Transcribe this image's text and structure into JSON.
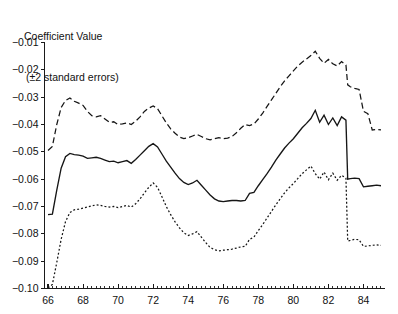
{
  "title": {
    "line1": "Coefficient Value",
    "line2": "(±2 standard errors)"
  },
  "chart_data": {
    "type": "line",
    "title": "Coefficient Value (±2 standard errors)",
    "xlabel": "",
    "ylabel": "Coefficient Value (±2 standard errors)",
    "xlim": [
      65.8,
      85.2
    ],
    "ylim": [
      -0.1,
      -0.01
    ],
    "grid": false,
    "legend": "none",
    "x_tick_labels": [
      "66",
      "68",
      "70",
      "72",
      "74",
      "76",
      "78",
      "80",
      "82",
      "84"
    ],
    "x_tick_values": [
      66,
      68,
      70,
      72,
      74,
      76,
      78,
      80,
      82,
      84
    ],
    "x_minor_tick_interval": 0.25,
    "y_tick_labels": [
      "-0.01",
      "-0.02",
      "-0.03",
      "-0.04",
      "-0.05",
      "-0.06",
      "-0.07",
      "-0.08",
      "-0.09",
      "-0.10"
    ],
    "y_tick_values": [
      -0.01,
      -0.02,
      -0.03,
      -0.04,
      -0.05,
      -0.06,
      -0.07,
      -0.08,
      -0.09,
      -0.1
    ],
    "x": [
      66.0,
      66.25,
      66.5,
      66.75,
      67.0,
      67.25,
      67.5,
      67.75,
      68.0,
      68.25,
      68.5,
      68.75,
      69.0,
      69.25,
      69.5,
      69.75,
      70.0,
      70.25,
      70.5,
      70.75,
      71.0,
      71.25,
      71.5,
      71.75,
      72.0,
      72.25,
      72.5,
      72.75,
      73.0,
      73.25,
      73.5,
      73.75,
      74.0,
      74.25,
      74.5,
      74.75,
      75.0,
      75.25,
      75.5,
      75.75,
      76.0,
      76.25,
      76.5,
      76.75,
      77.0,
      77.25,
      77.5,
      77.75,
      78.0,
      78.25,
      78.5,
      78.75,
      79.0,
      79.25,
      79.5,
      79.75,
      80.0,
      80.25,
      80.5,
      80.75,
      81.0,
      81.25,
      81.5,
      81.75,
      82.0,
      82.25,
      82.5,
      82.75,
      83.0,
      83.1,
      83.25,
      83.5,
      83.75,
      84.0,
      84.25,
      84.5,
      84.75,
      85.0
    ],
    "series": [
      {
        "name": "upper (+2 standard errors)",
        "style": "dashed",
        "values": [
          -0.0495,
          -0.048,
          -0.04,
          -0.0338,
          -0.0312,
          -0.0303,
          -0.0315,
          -0.0322,
          -0.033,
          -0.0352,
          -0.0368,
          -0.0372,
          -0.0368,
          -0.038,
          -0.0392,
          -0.039,
          -0.04,
          -0.0398,
          -0.0394,
          -0.04,
          -0.0388,
          -0.0372,
          -0.0352,
          -0.034,
          -0.0332,
          -0.0342,
          -0.0368,
          -0.0394,
          -0.0416,
          -0.0432,
          -0.0446,
          -0.0452,
          -0.0448,
          -0.0442,
          -0.0436,
          -0.0444,
          -0.0452,
          -0.0456,
          -0.0452,
          -0.0448,
          -0.0452,
          -0.045,
          -0.0444,
          -0.043,
          -0.0414,
          -0.04,
          -0.0404,
          -0.0398,
          -0.038,
          -0.0358,
          -0.0334,
          -0.031,
          -0.0286,
          -0.0262,
          -0.024,
          -0.0222,
          -0.0204,
          -0.0186,
          -0.0172,
          -0.016,
          -0.0148,
          -0.0132,
          -0.0158,
          -0.0176,
          -0.0162,
          -0.0178,
          -0.0186,
          -0.017,
          -0.0182,
          -0.0255,
          -0.0262,
          -0.0268,
          -0.0272,
          -0.0352,
          -0.036,
          -0.042,
          -0.0418,
          -0.042
        ]
      },
      {
        "name": "coefficient estimate",
        "style": "solid",
        "values": [
          -0.073,
          -0.0728,
          -0.064,
          -0.056,
          -0.0518,
          -0.0506,
          -0.051,
          -0.0512,
          -0.0516,
          -0.0524,
          -0.0522,
          -0.052,
          -0.0524,
          -0.053,
          -0.0536,
          -0.0534,
          -0.054,
          -0.0536,
          -0.0532,
          -0.0542,
          -0.0528,
          -0.0512,
          -0.0496,
          -0.048,
          -0.047,
          -0.0482,
          -0.0508,
          -0.0534,
          -0.0556,
          -0.0578,
          -0.0598,
          -0.0612,
          -0.062,
          -0.0614,
          -0.0604,
          -0.0622,
          -0.064,
          -0.0658,
          -0.0672,
          -0.068,
          -0.0682,
          -0.068,
          -0.0678,
          -0.0678,
          -0.068,
          -0.0678,
          -0.0652,
          -0.0648,
          -0.0624,
          -0.0602,
          -0.058,
          -0.0556,
          -0.053,
          -0.0508,
          -0.0486,
          -0.0468,
          -0.0452,
          -0.0432,
          -0.0412,
          -0.0396,
          -0.0378,
          -0.0348,
          -0.0392,
          -0.0366,
          -0.04,
          -0.0376,
          -0.0404,
          -0.0372,
          -0.0384,
          -0.06,
          -0.0598,
          -0.0596,
          -0.0598,
          -0.0628,
          -0.0626,
          -0.0624,
          -0.0622,
          -0.0624
        ]
      },
      {
        "name": "lower (−2 standard errors)",
        "style": "dotted",
        "values": [
          -0.0998,
          -0.0985,
          -0.0905,
          -0.082,
          -0.0755,
          -0.0722,
          -0.0712,
          -0.071,
          -0.0706,
          -0.0702,
          -0.0698,
          -0.0694,
          -0.0696,
          -0.07,
          -0.0702,
          -0.07,
          -0.0704,
          -0.07,
          -0.0696,
          -0.0702,
          -0.069,
          -0.0672,
          -0.065,
          -0.063,
          -0.0614,
          -0.063,
          -0.0664,
          -0.07,
          -0.073,
          -0.0756,
          -0.0778,
          -0.0796,
          -0.0806,
          -0.08,
          -0.0792,
          -0.0812,
          -0.0832,
          -0.085,
          -0.0858,
          -0.0862,
          -0.086,
          -0.0858,
          -0.0856,
          -0.0852,
          -0.0848,
          -0.0846,
          -0.082,
          -0.0812,
          -0.0788,
          -0.0766,
          -0.0742,
          -0.0718,
          -0.0694,
          -0.0672,
          -0.065,
          -0.0632,
          -0.0616,
          -0.0598,
          -0.058,
          -0.0566,
          -0.0552,
          -0.058,
          -0.06,
          -0.0574,
          -0.0602,
          -0.0578,
          -0.0604,
          -0.0586,
          -0.0596,
          -0.0826,
          -0.0824,
          -0.082,
          -0.0822,
          -0.0846,
          -0.0844,
          -0.0842,
          -0.084,
          -0.0842
        ]
      }
    ]
  }
}
